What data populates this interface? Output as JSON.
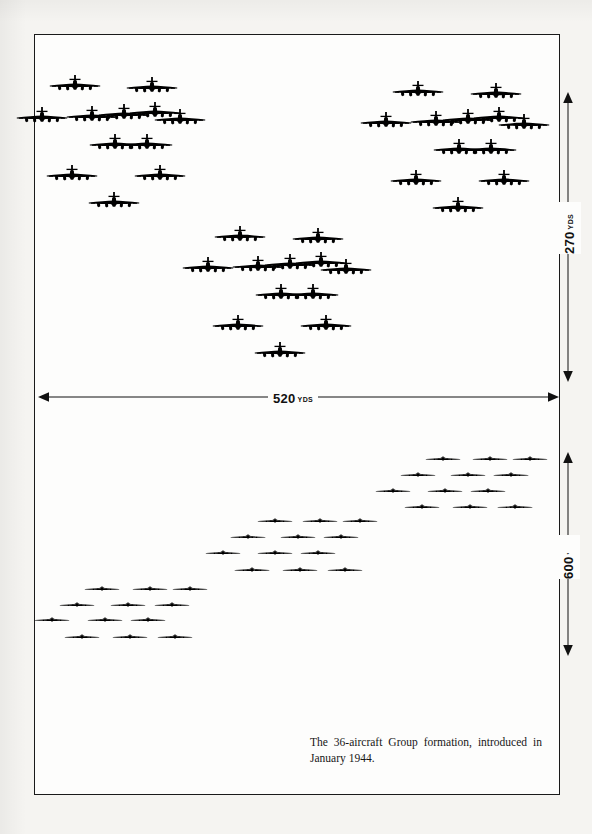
{
  "figure": {
    "caption": "The 36-aircraft Group formation, introduced in January 1944.",
    "aircraft_icon": "bomber-aircraft-icon",
    "total_aircraft": 36,
    "squadron_count": 3,
    "aircraft_per_squadron": 12,
    "ink_color": "#000000",
    "frame_color": "#1a1a1a",
    "paper_color": "#f5f4f1"
  },
  "dimensions": {
    "width": {
      "name": "formation-width",
      "value": "520",
      "unit": "YDS",
      "label": "520 YDS",
      "orientation": "horizontal"
    },
    "depth": {
      "name": "formation-depth",
      "value": "270",
      "unit": "YDS",
      "label": "270 YDS",
      "orientation": "vertical"
    },
    "altitude_spread": {
      "name": "formation-vertical-stack",
      "value": "600",
      "unit": "'",
      "label": "600'",
      "orientation": "vertical"
    }
  },
  "chart_data": {
    "type": "diagram",
    "title": "The 36-aircraft Group formation, introduced in January 1944.",
    "views": [
      {
        "name": "plan-view",
        "description": "Overhead plan view of three 12-aircraft squadrons forming a 36-aircraft Group",
        "span_yds": 520,
        "depth_yds": 270,
        "squadrons": [
          {
            "name": "lead-squadron-left",
            "aircraft": 12,
            "origin": [
              60,
              82
            ],
            "planes": [
              [
                75,
                86
              ],
              [
                42,
                118
              ],
              [
                92,
                117
              ],
              [
                124,
                115
              ],
              [
                155,
                113
              ],
              [
                152,
                88
              ],
              [
                180,
                120
              ],
              [
                115,
                145
              ],
              [
                147,
                145
              ],
              [
                72,
                176
              ],
              [
                160,
                176
              ],
              [
                114,
                203
              ]
            ]
          },
          {
            "name": "high-squadron-right",
            "aircraft": 12,
            "origin": [
              395,
              82
            ],
            "planes": [
              [
                418,
                92
              ],
              [
                386,
                123
              ],
              [
                436,
                122
              ],
              [
                468,
                120
              ],
              [
                499,
                118
              ],
              [
                496,
                94
              ],
              [
                524,
                125
              ],
              [
                459,
                150
              ],
              [
                491,
                150
              ],
              [
                416,
                181
              ],
              [
                504,
                181
              ],
              [
                458,
                208
              ]
            ]
          },
          {
            "name": "low-squadron-center",
            "aircraft": 12,
            "origin": [
              215,
              228
            ],
            "planes": [
              [
                240,
                237
              ],
              [
                208,
                268
              ],
              [
                258,
                267
              ],
              [
                290,
                265
              ],
              [
                321,
                263
              ],
              [
                318,
                239
              ],
              [
                346,
                270
              ],
              [
                281,
                295
              ],
              [
                313,
                295
              ],
              [
                238,
                326
              ],
              [
                326,
                326
              ],
              [
                280,
                353
              ]
            ]
          }
        ]
      },
      {
        "name": "elevation-view",
        "description": "Side elevation showing the three squadrons stacked across 600 feet of altitude",
        "vertical_spread_ft": 600,
        "groups": [
          {
            "name": "low-squadron-elevation",
            "aircraft": 12,
            "rows": [
              {
                "y": 589,
                "xs": [
                  102,
                  150,
                  190
                ]
              },
              {
                "y": 605,
                "xs": [
                  77,
                  128,
                  172
                ]
              },
              {
                "y": 620,
                "xs": [
                  52,
                  105,
                  148
                ]
              },
              {
                "y": 637,
                "xs": [
                  82,
                  130,
                  175
                ]
              }
            ]
          },
          {
            "name": "lead-squadron-elevation",
            "aircraft": 12,
            "rows": [
              {
                "y": 521,
                "xs": [
                  275,
                  320,
                  360
                ]
              },
              {
                "y": 537,
                "xs": [
                  248,
                  298,
                  341
                ]
              },
              {
                "y": 553,
                "xs": [
                  223,
                  275,
                  318
                ]
              },
              {
                "y": 570,
                "xs": [
                  252,
                  300,
                  345
                ]
              }
            ]
          },
          {
            "name": "high-squadron-elevation",
            "aircraft": 12,
            "rows": [
              {
                "y": 459,
                "xs": [
                  443,
                  490,
                  530
                ]
              },
              {
                "y": 475,
                "xs": [
                  418,
                  468,
                  511
                ]
              },
              {
                "y": 491,
                "xs": [
                  393,
                  445,
                  488
                ]
              },
              {
                "y": 507,
                "xs": [
                  422,
                  470,
                  515
                ]
              }
            ]
          }
        ]
      }
    ],
    "annotations": [
      {
        "name": "width-dimension",
        "text": "520 YDS",
        "position": "horizontal-center",
        "y": 397
      },
      {
        "name": "depth-dimension",
        "text": "270 YDS",
        "position": "right-upper",
        "x": 568
      },
      {
        "name": "altitude-dimension",
        "text": "600'",
        "position": "right-lower",
        "x": 568
      }
    ]
  }
}
